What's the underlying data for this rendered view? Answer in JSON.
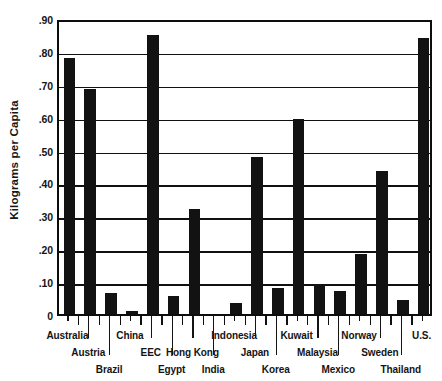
{
  "chart_data": {
    "type": "bar",
    "title": "",
    "xlabel": "",
    "ylabel": "Kilograms per Capita",
    "ylim": [
      0,
      0.9
    ],
    "grid": true,
    "legend": "none",
    "ytick_labels": [
      ".90",
      ".80",
      ".70",
      ".60",
      ".50",
      ".40",
      ".30",
      ".20",
      ".10",
      "0"
    ],
    "ytick_values": [
      0.9,
      0.8,
      0.7,
      0.6,
      0.5,
      0.4,
      0.3,
      0.2,
      0.1,
      0
    ],
    "categories": [
      "Australia",
      "Austria",
      "Brazil",
      "China",
      "EEC",
      "Egypt",
      "Hong Kong",
      "India",
      "Indonesia",
      "Japan",
      "Korea",
      "Kuwait",
      "Malaysia",
      "Mexico",
      "Norway",
      "Sweden",
      "Thailand",
      "U.S."
    ],
    "values": [
      0.785,
      0.69,
      0.07,
      0.015,
      0.855,
      0.06,
      0.325,
      0.0,
      0.04,
      0.485,
      0.085,
      0.6,
      0.095,
      0.075,
      0.19,
      0.44,
      0.05,
      0.845
    ],
    "bar_color": "#121212",
    "axis_color": "#0d0d0d",
    "label_rows": [
      0,
      1,
      2,
      0,
      1,
      2,
      1,
      2,
      0,
      1,
      2,
      0,
      1,
      2,
      0,
      1,
      2,
      0
    ]
  }
}
